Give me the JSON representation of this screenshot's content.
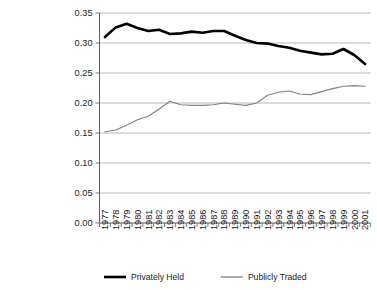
{
  "chart_data": {
    "type": "line",
    "title": "",
    "xlabel": "",
    "ylabel": "",
    "ylim": [
      0.0,
      0.35
    ],
    "ytick_interval": 0.05,
    "ytick_labels": [
      "0.00",
      "0.05",
      "0.10",
      "0.15",
      "0.20",
      "0.25",
      "0.30",
      "0.35"
    ],
    "ytick_values": [
      0.0,
      0.05,
      0.1,
      0.15,
      0.2,
      0.25,
      0.3,
      0.35
    ],
    "grid": "horizontal",
    "legend_position": "bottom-center",
    "xtick_rotation": 90,
    "categories": [
      "1977",
      "1978",
      "1979",
      "1980",
      "1981",
      "1982",
      "1983",
      "1984",
      "1985",
      "1986",
      "1987",
      "1988",
      "1989",
      "1990",
      "1991",
      "1992",
      "1993",
      "1994",
      "1995",
      "1996",
      "1997",
      "1998",
      "1999",
      "2000",
      "2001"
    ],
    "series": [
      {
        "name": "Privately Held",
        "color": "#000000",
        "line_width": "thick",
        "values": [
          0.31,
          0.326,
          0.332,
          0.325,
          0.32,
          0.322,
          0.315,
          0.316,
          0.319,
          0.317,
          0.32,
          0.32,
          0.312,
          0.305,
          0.3,
          0.299,
          0.295,
          0.292,
          0.287,
          0.284,
          0.281,
          0.282,
          0.29,
          0.28,
          0.265
        ]
      },
      {
        "name": "Publicly Traded",
        "color": "#808080",
        "line_width": "thin",
        "values": [
          0.152,
          0.155,
          0.163,
          0.172,
          0.178,
          0.19,
          0.203,
          0.197,
          0.196,
          0.196,
          0.197,
          0.2,
          0.198,
          0.196,
          0.2,
          0.213,
          0.218,
          0.22,
          0.215,
          0.214,
          0.219,
          0.224,
          0.228,
          0.229,
          0.228
        ]
      }
    ]
  },
  "legend": {
    "entries": [
      {
        "label": "Privately Held"
      },
      {
        "label": "Publicly Traded"
      }
    ]
  }
}
